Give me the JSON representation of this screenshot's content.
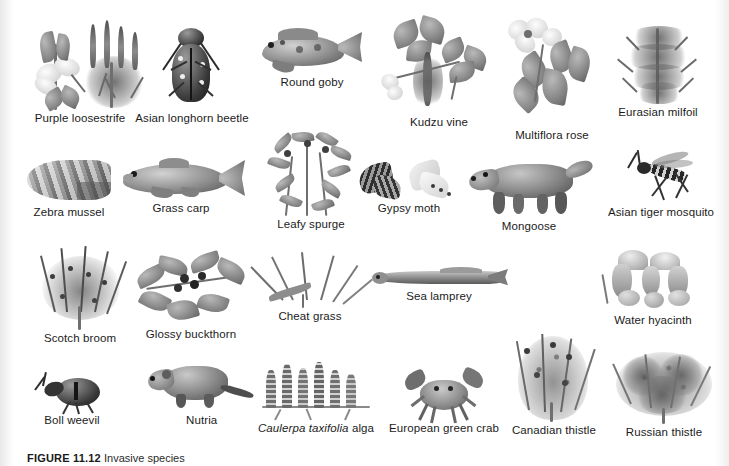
{
  "figure": {
    "label": "FIGURE 11.12",
    "caption_text": "Invasive species",
    "background_color": "#ffffff",
    "text_color": "#1b1b1b",
    "rows": 4,
    "total_species": 24
  },
  "species": [
    {
      "name": "Purple loosestrife",
      "kind": "plant",
      "row": 1,
      "x": 16,
      "y": 18,
      "w": 122,
      "h": 92,
      "label_x": 22,
      "label_y": 113
    },
    {
      "name": "Asian longhorn beetle",
      "kind": "insect",
      "row": 1,
      "x": 148,
      "y": 18,
      "w": 96,
      "h": 92,
      "label_x": 141,
      "label_y": 113
    },
    {
      "name": "Round goby",
      "kind": "fish",
      "row": 1,
      "x": 256,
      "y": 24,
      "w": 108,
      "h": 56,
      "label_x": 287,
      "label_y": 80
    },
    {
      "name": "Kudzu vine",
      "kind": "plant",
      "row": 1,
      "x": 376,
      "y": 18,
      "w": 112,
      "h": 100,
      "label_x": 437,
      "label_y": 119
    },
    {
      "name": "Multiflora rose",
      "kind": "plant",
      "row": 1,
      "x": 498,
      "y": 18,
      "w": 104,
      "h": 110,
      "label_x": 512,
      "label_y": 131
    },
    {
      "name": "Eurasian milfoil",
      "kind": "plant",
      "row": 1,
      "x": 612,
      "y": 24,
      "w": 86,
      "h": 82,
      "label_x": 613,
      "label_y": 111
    },
    {
      "name": "Zebra mussel",
      "kind": "mollusc",
      "row": 2,
      "x": 20,
      "y": 152,
      "w": 96,
      "h": 56,
      "label_x": 24,
      "label_y": 208
    },
    {
      "name": "Grass carp",
      "kind": "fish",
      "row": 2,
      "x": 108,
      "y": 158,
      "w": 124,
      "h": 50,
      "label_x": 184,
      "label_y": 203
    },
    {
      "name": "Leafy spurge",
      "kind": "plant",
      "row": 2,
      "x": 262,
      "y": 128,
      "w": 84,
      "h": 90,
      "label_x": 272,
      "label_y": 221
    },
    {
      "name": "Gypsy moth",
      "kind": "insect",
      "row": 2,
      "x": 358,
      "y": 160,
      "w": 96,
      "h": 46,
      "label_x": 383,
      "label_y": 206
    },
    {
      "name": "Mongoose",
      "kind": "mammal",
      "row": 2,
      "x": 466,
      "y": 158,
      "w": 124,
      "h": 62,
      "label_x": 502,
      "label_y": 222
    },
    {
      "name": "Asian tiger mosquito",
      "kind": "insect",
      "row": 2,
      "x": 608,
      "y": 150,
      "w": 96,
      "h": 56,
      "label_x": 612,
      "label_y": 207
    },
    {
      "name": "Scotch broom",
      "kind": "plant",
      "row": 3,
      "x": 34,
      "y": 246,
      "w": 88,
      "h": 86,
      "label_x": 38,
      "label_y": 335
    },
    {
      "name": "Glossy buckthorn",
      "kind": "plant",
      "row": 3,
      "x": 134,
      "y": 248,
      "w": 112,
      "h": 80,
      "label_x": 140,
      "label_y": 331
    },
    {
      "name": "Cheat grass",
      "kind": "plant",
      "row": 3,
      "x": 268,
      "y": 254,
      "w": 86,
      "h": 60,
      "label_x": 262,
      "label_y": 318
    },
    {
      "name": "Sea lamprey",
      "kind": "fish",
      "row": 3,
      "x": 372,
      "y": 268,
      "w": 130,
      "h": 28,
      "label_x": 406,
      "label_y": 295
    },
    {
      "name": "Water hyacinth",
      "kind": "plant",
      "row": 3,
      "x": 598,
      "y": 256,
      "w": 100,
      "h": 62,
      "label_x": 612,
      "label_y": 317
    },
    {
      "name": "Boll weevil",
      "kind": "insect",
      "row": 4,
      "x": 32,
      "y": 372,
      "w": 72,
      "h": 44,
      "label_x": 50,
      "label_y": 416
    },
    {
      "name": "Nutria",
      "kind": "mammal",
      "row": 4,
      "x": 134,
      "y": 362,
      "w": 90,
      "h": 54,
      "label_x": 196,
      "label_y": 418
    },
    {
      "name": "Caulerpa taxifolia alga",
      "kind": "alga",
      "row": 4,
      "x": 264,
      "y": 362,
      "w": 104,
      "h": 62,
      "label_x": 254,
      "label_y": 426,
      "italic_part": "Caulerpa taxifolia",
      "plain_part": " alga"
    },
    {
      "name": "European green crab",
      "kind": "crab",
      "row": 4,
      "x": 392,
      "y": 368,
      "w": 92,
      "h": 56,
      "label_x": 388,
      "label_y": 426
    },
    {
      "name": "Canadian thistle",
      "kind": "plant",
      "row": 4,
      "x": 508,
      "y": 334,
      "w": 92,
      "h": 92,
      "label_x": 505,
      "label_y": 426
    },
    {
      "name": "Russian thistle",
      "kind": "plant",
      "row": 4,
      "x": 614,
      "y": 354,
      "w": 100,
      "h": 72,
      "label_x": 619,
      "label_y": 426
    }
  ]
}
